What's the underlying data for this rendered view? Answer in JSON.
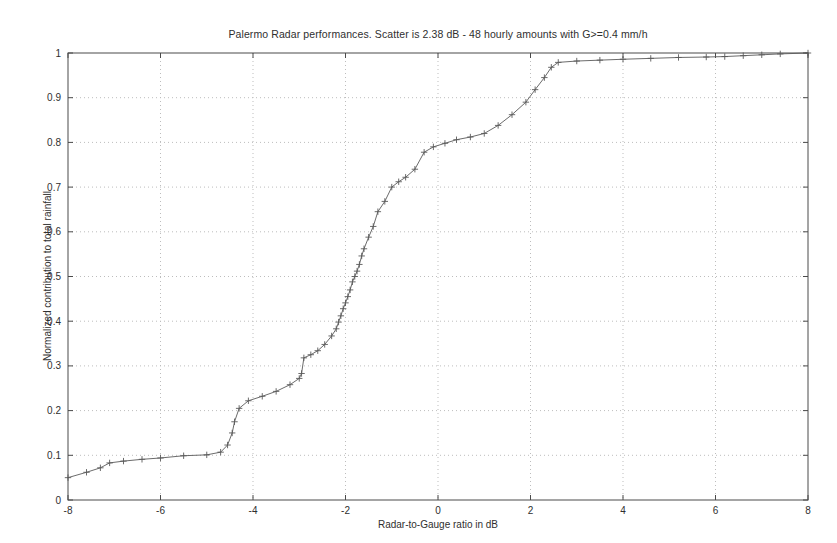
{
  "chart_data": {
    "type": "line",
    "title": "Palermo Radar performances. Scatter is 2.38 dB - 48 hourly amounts with G>=0.4 mm/h",
    "xlabel": "Radar-to-Gauge ratio in dB",
    "ylabel": "Normalized contribution to total rainfall",
    "xlim": [
      -8,
      8
    ],
    "ylim": [
      0,
      1
    ],
    "xticks": [
      -8,
      -6,
      -4,
      -2,
      0,
      2,
      4,
      6,
      8
    ],
    "xtick_labels": [
      "-8",
      "-6",
      "-4",
      "-2",
      "0",
      "2",
      "4",
      "6",
      "8"
    ],
    "yticks": [
      0,
      0.1,
      0.2,
      0.3,
      0.4,
      0.5,
      0.6,
      0.7,
      0.8,
      0.9,
      1
    ],
    "ytick_labels": [
      "0",
      "0.1",
      "0.2",
      "0.3",
      "0.4",
      "0.5",
      "0.6",
      "0.7",
      "0.8",
      "0.9",
      "1"
    ],
    "grid": true,
    "grid_style": "dotted",
    "legend": null,
    "marker": "+",
    "line_color": "#5a5a5a",
    "series": [
      {
        "name": "Cumulative normalized contribution",
        "x": [
          -8.0,
          -7.6,
          -7.3,
          -7.1,
          -6.8,
          -6.4,
          -6.0,
          -5.5,
          -5.0,
          -4.7,
          -4.55,
          -4.45,
          -4.4,
          -4.3,
          -4.1,
          -3.8,
          -3.5,
          -3.2,
          -3.0,
          -2.95,
          -2.9,
          -2.75,
          -2.6,
          -2.45,
          -2.3,
          -2.2,
          -2.15,
          -2.1,
          -2.05,
          -2.0,
          -1.95,
          -1.9,
          -1.85,
          -1.8,
          -1.75,
          -1.7,
          -1.65,
          -1.6,
          -1.5,
          -1.4,
          -1.3,
          -1.15,
          -1.0,
          -0.85,
          -0.7,
          -0.5,
          -0.3,
          -0.1,
          0.15,
          0.4,
          0.7,
          1.0,
          1.3,
          1.6,
          1.9,
          2.1,
          2.3,
          2.45,
          2.6,
          3.0,
          3.5,
          4.0,
          4.6,
          5.2,
          5.8,
          6.2,
          6.6,
          7.0,
          7.4,
          8.0
        ],
        "y": [
          0.05,
          0.062,
          0.072,
          0.083,
          0.087,
          0.091,
          0.094,
          0.099,
          0.101,
          0.107,
          0.123,
          0.15,
          0.175,
          0.205,
          0.222,
          0.232,
          0.243,
          0.258,
          0.272,
          0.283,
          0.318,
          0.325,
          0.334,
          0.348,
          0.367,
          0.383,
          0.398,
          0.412,
          0.428,
          0.441,
          0.455,
          0.47,
          0.488,
          0.5,
          0.512,
          0.527,
          0.546,
          0.562,
          0.588,
          0.612,
          0.645,
          0.668,
          0.7,
          0.712,
          0.722,
          0.74,
          0.778,
          0.79,
          0.798,
          0.806,
          0.812,
          0.82,
          0.838,
          0.862,
          0.89,
          0.918,
          0.945,
          0.968,
          0.979,
          0.982,
          0.984,
          0.986,
          0.988,
          0.99,
          0.991,
          0.992,
          0.994,
          0.996,
          0.998,
          1.0
        ]
      }
    ]
  },
  "axes": {
    "box_color": "#4a4a4a",
    "grid_color": "#bdbdbd"
  }
}
